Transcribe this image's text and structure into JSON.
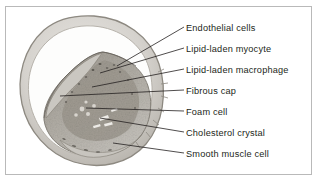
{
  "figure": {
    "frame_color": "#b9b9b9",
    "background_color": "#ffffff",
    "text_color": "#231f20",
    "leader_color": "#231f20"
  },
  "specimen": {
    "name": "artery-cross-section",
    "description": "Histological cross-section of an artery containing an eccentric atherosclerotic plaque",
    "wall_color": "#d8d6d2",
    "plaque_color": "#a9a59d",
    "lumen_color": "#ffffff"
  },
  "labels": [
    {
      "id": "endothelial-cells",
      "text": "Endothelial cells",
      "y": 28,
      "anchor_x": 117,
      "anchor_y": 66
    },
    {
      "id": "lipid-laden-myocyte",
      "text": "Lipid-laden myocyte",
      "y": 49,
      "anchor_x": 100,
      "anchor_y": 73
    },
    {
      "id": "lipid-laden-macrophage",
      "text": "Lipid-laden macrophage",
      "y": 70,
      "anchor_x": 92,
      "anchor_y": 87
    },
    {
      "id": "fibrous-cap",
      "text": "Fibrous cap",
      "y": 91,
      "anchor_x": 60,
      "anchor_y": 96
    },
    {
      "id": "foam-cell",
      "text": "Foam cell",
      "y": 112,
      "anchor_x": 86,
      "anchor_y": 108
    },
    {
      "id": "cholesterol-crystal",
      "text": "Cholesterol crystal",
      "y": 133,
      "anchor_x": 100,
      "anchor_y": 118
    },
    {
      "id": "smooth-muscle-cell",
      "text": "Smooth muscle cell",
      "y": 154,
      "anchor_x": 113,
      "anchor_y": 143
    }
  ]
}
